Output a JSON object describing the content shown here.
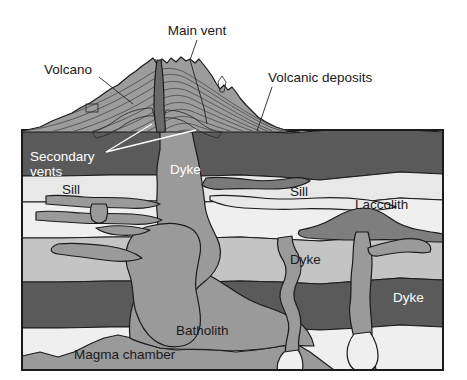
{
  "diagram": {
    "frame": {
      "x": 22,
      "y": 130,
      "width": 421,
      "height": 240
    },
    "background_color": "#ffffff",
    "border_color": "#1b1b1b"
  },
  "palette": {
    "white_bg": "#ffffff",
    "layer_dark": "#5a5a5a",
    "layer_light": "#e2e2e2",
    "layer_midlight": "#c9c9c9",
    "layer_mid": "#b0b0b0",
    "layer_pale": "#efefef",
    "magma": "#9a9a9a",
    "cone_fill": "#9c9c9c",
    "outline": "#1b1b1b",
    "text_dark": "#1a1a1a",
    "text_light": "#ffffff"
  },
  "labels": [
    {
      "id": "main-vent",
      "text": "Main vent",
      "x": 197,
      "y": 31,
      "anchor": "middle",
      "color": "dark",
      "leader": "M 197 40 L 190 60 L 205 110 L 207 124"
    },
    {
      "id": "volcano",
      "text": "Volcano",
      "x": 44,
      "y": 70,
      "anchor": "start",
      "color": "dark",
      "leader": "M 99 77 L 130 103"
    },
    {
      "id": "volcanic-deposits",
      "text": "Volcanic deposits",
      "x": 268,
      "y": 78,
      "anchor": "start",
      "color": "dark",
      "leader": "M 272 87 L 258 130"
    },
    {
      "id": "secondary-vents",
      "text": "Secondary",
      "text2": "vents",
      "x": 30,
      "y": 157,
      "anchor": "start",
      "color": "white",
      "leader": "M 104 152 L 150 125 M 104 152 L 190 131"
    },
    {
      "id": "dyke-main",
      "text": "Dyke",
      "x": 170,
      "y": 170,
      "anchor": "start",
      "color": "white",
      "leader": ""
    },
    {
      "id": "sill-left",
      "text": "Sill",
      "x": 62,
      "y": 190,
      "anchor": "start",
      "color": "dark",
      "leader": ""
    },
    {
      "id": "sill-right",
      "text": "Sill",
      "x": 290,
      "y": 192,
      "anchor": "start",
      "color": "dark",
      "leader": ""
    },
    {
      "id": "laccolith",
      "text": "Laccolith",
      "x": 355,
      "y": 205,
      "anchor": "start",
      "color": "dark",
      "leader": ""
    },
    {
      "id": "dyke-middle",
      "text": "Dyke",
      "x": 290,
      "y": 260,
      "anchor": "start",
      "color": "dark",
      "leader": ""
    },
    {
      "id": "dyke-right",
      "text": "Dyke",
      "x": 393,
      "y": 298,
      "anchor": "start",
      "color": "white",
      "leader": ""
    },
    {
      "id": "batholith",
      "text": "Batholith",
      "x": 176,
      "y": 331,
      "anchor": "start",
      "color": "dark",
      "leader": ""
    },
    {
      "id": "magma-chamber",
      "text": "Magma chamber",
      "x": 74,
      "y": 355,
      "anchor": "start",
      "color": "dark",
      "leader": ""
    }
  ],
  "features": {
    "volcano_cone": "stratified cone with layered flow lines",
    "main_vent_conduit": "vertical central conduit from magma chamber to summit crater",
    "secondary_vents": 2,
    "sills": 2,
    "dykes": 3,
    "laccolith": 1,
    "batholith": 1,
    "magma_chamber": 1
  },
  "strata": [
    {
      "name": "volcanic-deposits-layer",
      "shade": "dark"
    },
    {
      "name": "upper-light-band",
      "shade": "light"
    },
    {
      "name": "mid-light-band",
      "shade": "pale"
    },
    {
      "name": "mid-gray-band",
      "shade": "midlight"
    },
    {
      "name": "lower-dark-band",
      "shade": "dark"
    },
    {
      "name": "basement-pale-band",
      "shade": "pale"
    }
  ]
}
